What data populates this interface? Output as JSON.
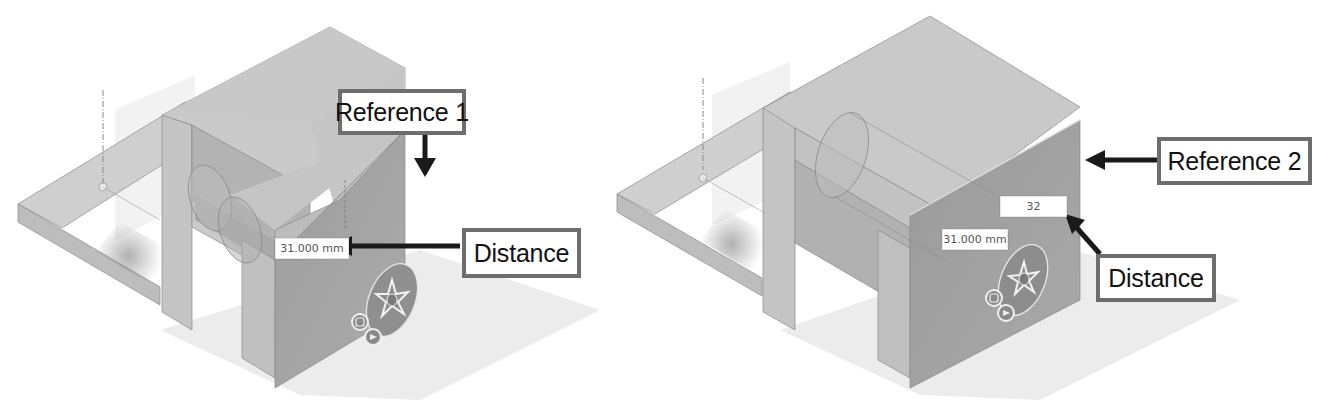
{
  "figure": {
    "panels": [
      {
        "id": "left",
        "reference_callout": {
          "label": "Reference 1",
          "arrow_direction": "down"
        },
        "distance_callout": {
          "label": "Distance",
          "arrow_direction": "left"
        },
        "distance_field": {
          "value": "31.000 mm"
        },
        "manipulator": {
          "icon": "move-compass-icon",
          "buttons": [
            "rotate-left-icon",
            "rotate-right-icon"
          ]
        }
      },
      {
        "id": "right",
        "reference_callout": {
          "label": "Reference 2",
          "arrow_direction": "left"
        },
        "distance_callout": {
          "label": "Distance",
          "arrow_direction": "up-left"
        },
        "distance_field": {
          "value": "31.000 mm"
        },
        "edit_field": {
          "value": "32"
        },
        "manipulator": {
          "icon": "move-compass-icon",
          "buttons": [
            "rotate-left-icon",
            "rotate-right-icon"
          ]
        }
      }
    ],
    "colors": {
      "top_face": "#c9c9c9",
      "left_face": "#b7b7b7",
      "front_face": "#a3a3a3",
      "shadow": "#e8e8e8",
      "callout_border": "#6d6d6d",
      "arrow": "#1a1a1a"
    }
  }
}
